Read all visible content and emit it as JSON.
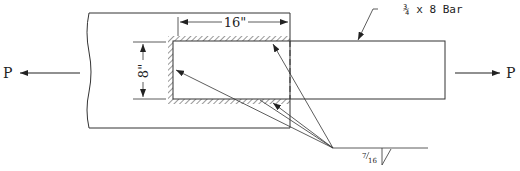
{
  "diagram": {
    "type": "welded lap joint (fillet weld) engineering sketch",
    "labels": {
      "load_left": "P",
      "load_right": "P",
      "bar_label": "¾ x 8 Bar",
      "dim_length": "16\"",
      "dim_width": "8\"",
      "weld_size_num": "7",
      "weld_size_den": "16"
    },
    "colors": {
      "line": "#333333",
      "background": "#ffffff"
    }
  }
}
